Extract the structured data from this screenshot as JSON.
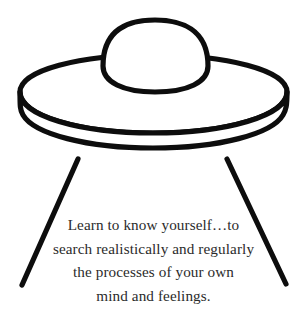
{
  "image": {
    "kind": "line-drawing",
    "subject": "flying-saucer",
    "background_color": "#ffffff",
    "ink_color": "#0d0d0d",
    "text_color": "#2b2b2b"
  },
  "illustration": {
    "dome_label": "saucer-dome",
    "body_label": "saucer-body",
    "rim_label": "saucer-rim",
    "left_leg_label": "saucer-left-leg",
    "right_leg_label": "saucer-right-leg"
  },
  "caption": {
    "lines": [
      "Learn to know yourself…to",
      "search realistically and regularly",
      "the processes of your own",
      "mind and feelings."
    ],
    "full_text": "Learn to know yourself…to search realistically and regularly the processes of your own mind and feelings."
  }
}
